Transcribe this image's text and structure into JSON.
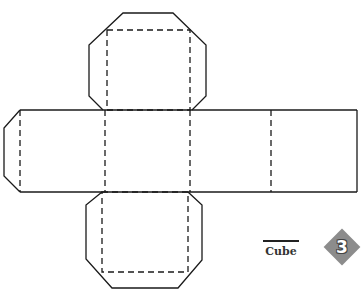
{
  "figure": {
    "title": "Cube",
    "badge_number": "3",
    "badge_color": "#8c8c8c",
    "line_color": "#1a1a1a",
    "fold_line_style": "dashed",
    "cut_line_style": "solid"
  },
  "net": {
    "faces": [
      "top",
      "left",
      "front",
      "right",
      "back",
      "bottom"
    ],
    "flaps": [
      "top-flap",
      "left-flap",
      "bottom-flap"
    ]
  }
}
